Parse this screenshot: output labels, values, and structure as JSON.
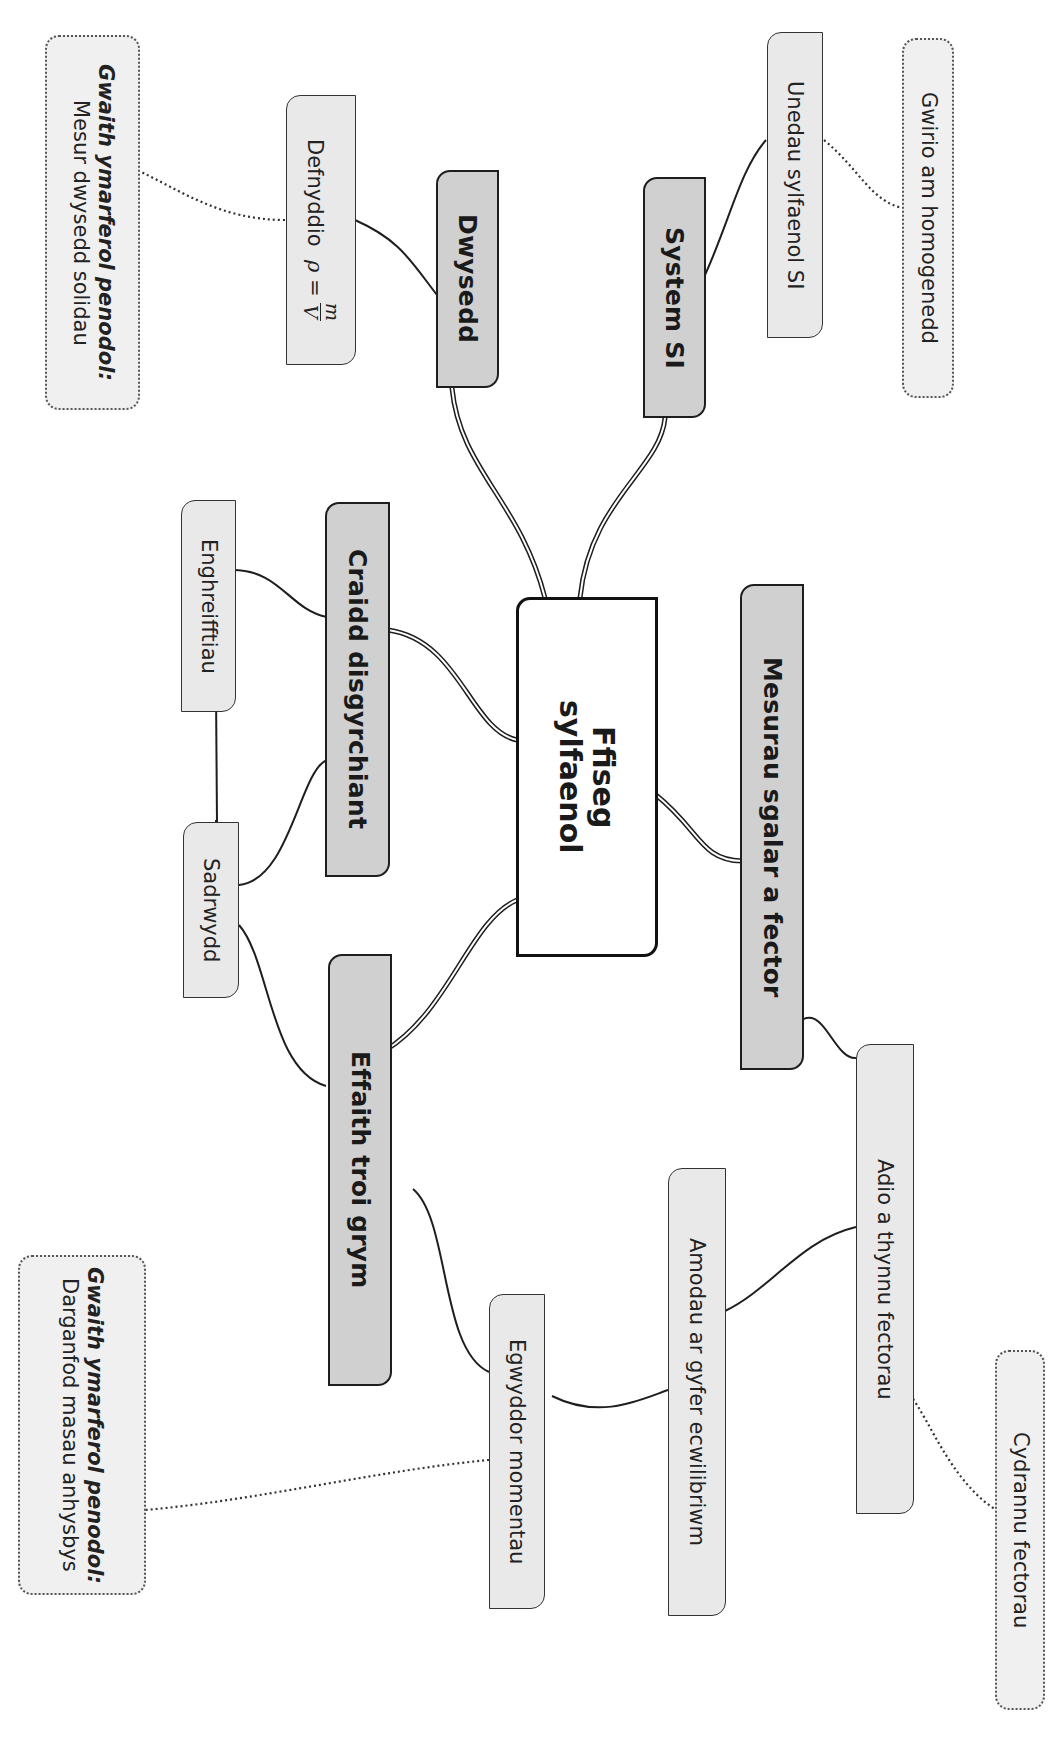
{
  "center": {
    "line1": "Ffiseg",
    "line2": "sylfaenol"
  },
  "branches": [
    {
      "id": "dwysedd",
      "label": "Dwysedd"
    },
    {
      "id": "system_si",
      "label": "System SI"
    },
    {
      "id": "craidd",
      "label": "Craidd disgyrchiant"
    },
    {
      "id": "effaith",
      "label": "Effaith troi grym"
    },
    {
      "id": "mesurau",
      "label": "Mesurau sgalar a fector"
    }
  ],
  "subnodes": {
    "defnyddio": {
      "label": "Defnyddio",
      "formula_lhs": "ρ =",
      "formula_num": "m",
      "formula_den": "V"
    },
    "unedau": {
      "label": "Unedau sylfaenol SI"
    },
    "enghreifftiau": {
      "label": "Enghreifftiau"
    },
    "sadrwydd": {
      "label": "Sadrwydd"
    },
    "egwyddor": {
      "label": "Egwyddor momentau"
    },
    "amodau": {
      "label": "Amodau ar gyfer ecwilibriwm"
    },
    "adio": {
      "label": "Adio a thynnu fectorau"
    }
  },
  "notes": {
    "practical1": {
      "heading": "Gwaith ymarferol penodol:",
      "body": "Mesur dwysedd solidau"
    },
    "practical2": {
      "heading": "Gwaith ymarferol penodol:",
      "body": "Darganfod masau anhysbys"
    },
    "homogenedd": {
      "body": "Gwirio am homogenedd"
    },
    "cydrannu": {
      "body": "Cydrannu fectorau"
    }
  },
  "colors": {
    "main_fill": "#d0d0d0",
    "sub_fill": "#e9e9e9",
    "note_fill": "#f0f0f0",
    "line": "#1e1e1e"
  }
}
